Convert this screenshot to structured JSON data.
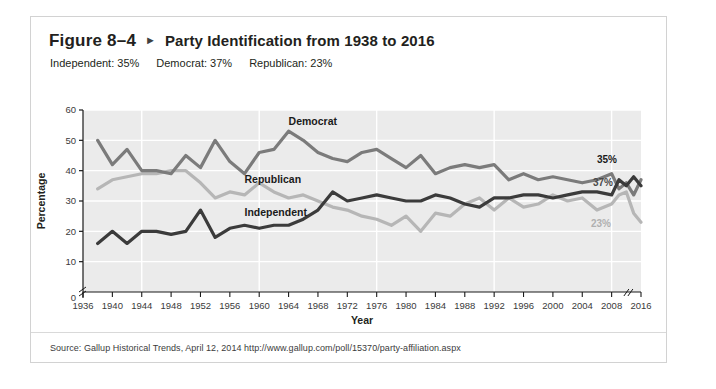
{
  "figure": {
    "number": "Figure 8–4",
    "arrow_icon": "triangle-right-icon",
    "title": "Party Identification from 1938 to 2016",
    "summary": [
      "Independent: 35%",
      "Democrat: 37%",
      "Republican: 23%"
    ],
    "source": "Source: Gallup Historical Trends, April 12, 2014 http://www.gallup.com/poll/15370/party-affiliation.aspx"
  },
  "chart_data": {
    "type": "line",
    "title": "Party Identification from 1938 to 2016",
    "xlabel": "Year",
    "ylabel": "Percentage",
    "xlim": [
      1936,
      2016
    ],
    "ylim": [
      0,
      60
    ],
    "y_ticks": [
      0,
      10,
      20,
      30,
      40,
      50,
      60
    ],
    "y_axis_break_between": [
      0,
      10
    ],
    "x_ticks": [
      1936,
      1940,
      1944,
      1948,
      1952,
      1956,
      1960,
      1964,
      1968,
      1972,
      1976,
      1980,
      1984,
      1988,
      1992,
      1996,
      2000,
      2004,
      2008,
      2016
    ],
    "x_axis_break_between": [
      2008,
      2016
    ],
    "grid": true,
    "legend_position": "inline-labels",
    "plot_background": "#ebebeb",
    "gridline_color": "#ffffff",
    "series": [
      {
        "name": "Democrat",
        "color": "#7b7b7b",
        "label_x": 1964,
        "label_y": 55,
        "end_label": "37%",
        "x": [
          1938,
          1940,
          1942,
          1944,
          1946,
          1948,
          1950,
          1952,
          1954,
          1956,
          1958,
          1960,
          1962,
          1964,
          1966,
          1968,
          1970,
          1972,
          1974,
          1976,
          1978,
          1980,
          1982,
          1984,
          1986,
          1988,
          1990,
          1992,
          1994,
          1996,
          1998,
          2000,
          2002,
          2004,
          2006,
          2008,
          2010,
          2012,
          2014,
          2016
        ],
        "values": [
          50,
          42,
          47,
          40,
          40,
          39,
          45,
          41,
          50,
          43,
          39,
          46,
          47,
          53,
          50,
          46,
          44,
          43,
          46,
          47,
          44,
          41,
          45,
          39,
          41,
          42,
          41,
          42,
          37,
          39,
          37,
          38,
          37,
          36,
          37,
          39,
          34,
          36,
          32,
          37
        ]
      },
      {
        "name": "Republican",
        "color": "#b6b6b6",
        "label_x": 1958,
        "label_y": 36,
        "end_label": "23%",
        "x": [
          1938,
          1940,
          1942,
          1944,
          1946,
          1948,
          1950,
          1952,
          1954,
          1956,
          1958,
          1960,
          1962,
          1964,
          1966,
          1968,
          1970,
          1972,
          1974,
          1976,
          1978,
          1980,
          1982,
          1984,
          1986,
          1988,
          1990,
          1992,
          1994,
          1996,
          1998,
          2000,
          2002,
          2004,
          2006,
          2008,
          2010,
          2012,
          2014,
          2016
        ],
        "values": [
          34,
          37,
          38,
          39,
          39,
          40,
          40,
          36,
          31,
          33,
          32,
          36,
          33,
          31,
          32,
          30,
          28,
          27,
          25,
          24,
          22,
          25,
          20,
          26,
          25,
          29,
          31,
          27,
          31,
          28,
          29,
          32,
          30,
          31,
          27,
          29,
          32,
          33,
          26,
          23
        ]
      },
      {
        "name": "Independent",
        "color": "#3b3b3b",
        "label_x": 1958,
        "label_y": 25,
        "end_label": "35%",
        "x": [
          1938,
          1940,
          1942,
          1944,
          1946,
          1948,
          1950,
          1952,
          1954,
          1956,
          1958,
          1960,
          1962,
          1964,
          1966,
          1968,
          1970,
          1972,
          1974,
          1976,
          1978,
          1980,
          1982,
          1984,
          1986,
          1988,
          1990,
          1992,
          1994,
          1996,
          1998,
          2000,
          2002,
          2004,
          2006,
          2008,
          2010,
          2012,
          2014,
          2016
        ],
        "values": [
          16,
          20,
          16,
          20,
          20,
          19,
          20,
          27,
          18,
          21,
          22,
          21,
          22,
          22,
          24,
          27,
          33,
          30,
          31,
          32,
          31,
          30,
          30,
          32,
          31,
          29,
          28,
          31,
          31,
          32,
          32,
          31,
          32,
          33,
          33,
          32,
          37,
          35,
          38,
          35
        ]
      }
    ]
  }
}
